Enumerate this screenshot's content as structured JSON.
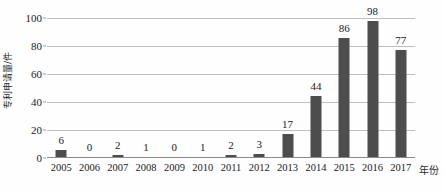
{
  "chart_data": {
    "type": "bar",
    "title": "",
    "xlabel": "年份",
    "ylabel": "专利申请量/件",
    "categories": [
      "2005",
      "2006",
      "2007",
      "2008",
      "2009",
      "2010",
      "2011",
      "2012",
      "2013",
      "2014",
      "2015",
      "2016",
      "2017"
    ],
    "values": [
      6,
      0,
      2,
      1,
      0,
      1,
      2,
      3,
      17,
      44,
      86,
      98,
      77
    ],
    "value_labels": [
      "6",
      "0",
      "2",
      "1",
      "0",
      "1",
      "2",
      "3",
      "17",
      "44",
      "86",
      "98",
      "77"
    ],
    "ylim": [
      0,
      100
    ],
    "y_ticks": [
      0,
      20,
      40,
      60,
      80,
      100
    ],
    "y_tick_labels": [
      "0",
      "20",
      "40",
      "60",
      "80",
      "100"
    ],
    "grid": true,
    "legend": false,
    "bar_color": "#4d4d4d",
    "gridline_color": "#bfbfbf",
    "background_color": "#fefefe",
    "text_color": "#1a1a1a"
  }
}
